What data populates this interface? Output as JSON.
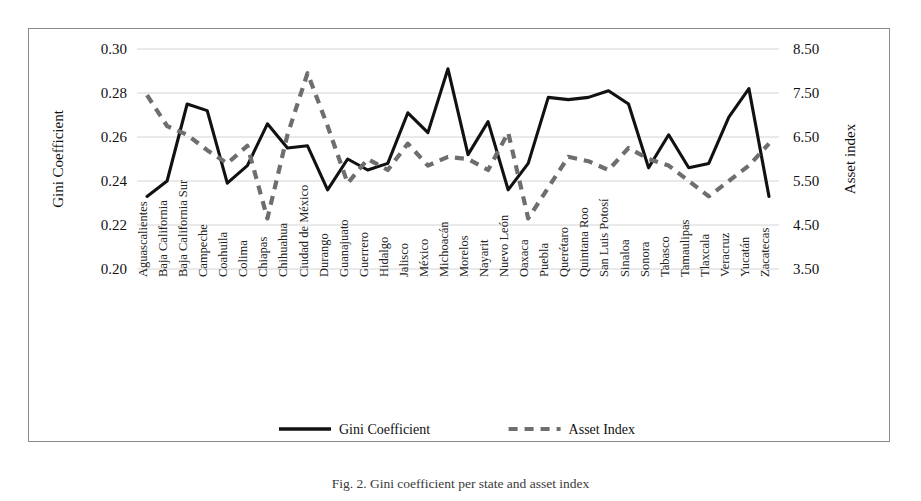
{
  "figure": {
    "caption": "Fig. 2. Gini coefficient per state and asset index",
    "background": "#ffffff",
    "border_color": "#8a8a8a"
  },
  "legend": {
    "position": "bottom-center",
    "items": [
      {
        "label": "Gini Coefficient",
        "style": "solid",
        "color": "#111111"
      },
      {
        "label": "Asset Index",
        "style": "dashed",
        "color": "#6e6e6e"
      }
    ]
  },
  "chart_data": {
    "type": "line",
    "title": "",
    "xlabel": "",
    "grid": true,
    "categories": [
      "Aguascalientes",
      "Baja California",
      "Baja California Sur",
      "Campeche",
      "Coahuila",
      "Colima",
      "Chiapas",
      "Chihuahua",
      "Ciudad de México",
      "Durango",
      "Guanajuato",
      "Guerrero",
      "Hidalgo",
      "Jalisco",
      "México",
      "Michoacán",
      "Morelos",
      "Nayarit",
      "Nuevo León",
      "Oaxaca",
      "Puebla",
      "Querétaro",
      "Quintana Roo",
      "San Luis Potosí",
      "Sinaloa",
      "Sonora",
      "Tabasco",
      "Tamaulipas",
      "Tlaxcala",
      "Veracruz",
      "Yucatán",
      "Zacatecas"
    ],
    "axes": {
      "left": {
        "label": "Gini Coefficient",
        "ylim": [
          0.2,
          0.3
        ],
        "ticks": [
          "0.20",
          "0.22",
          "0.24",
          "0.26",
          "0.28",
          "0.30"
        ],
        "tick_values": [
          0.2,
          0.22,
          0.24,
          0.26,
          0.28,
          0.3
        ]
      },
      "right": {
        "label": "Asset index",
        "ylim": [
          3.5,
          8.5
        ],
        "ticks": [
          "3.50",
          "4.50",
          "5.50",
          "6.50",
          "7.50",
          "8.50"
        ],
        "tick_values": [
          3.5,
          4.5,
          5.5,
          6.5,
          7.5,
          8.5
        ]
      }
    },
    "series": [
      {
        "name": "Gini Coefficient",
        "axis": "left",
        "style": "solid",
        "color": "#111111",
        "values": [
          0.233,
          0.24,
          0.275,
          0.272,
          0.239,
          0.247,
          0.266,
          0.255,
          0.256,
          0.236,
          0.25,
          0.245,
          0.248,
          0.271,
          0.262,
          0.291,
          0.252,
          0.267,
          0.236,
          0.248,
          0.278,
          0.277,
          0.278,
          0.281,
          0.275,
          0.246,
          0.261,
          0.246,
          0.248,
          0.269,
          0.282,
          0.233
        ]
      },
      {
        "name": "Asset Index",
        "axis": "right",
        "style": "dashed",
        "color": "#6e6e6e",
        "values": [
          7.45,
          6.75,
          6.55,
          6.2,
          5.9,
          6.3,
          4.65,
          6.55,
          7.95,
          6.75,
          5.45,
          6.0,
          5.75,
          6.35,
          5.85,
          6.05,
          6.0,
          5.75,
          6.6,
          4.65,
          5.35,
          6.05,
          5.95,
          5.75,
          6.25,
          6.0,
          5.85,
          5.5,
          5.15,
          5.5,
          5.85,
          6.35
        ]
      }
    ]
  }
}
